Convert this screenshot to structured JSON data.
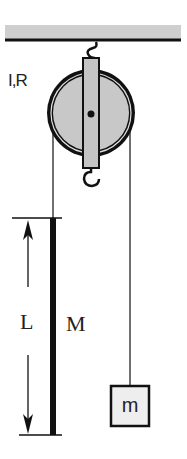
{
  "diagram": {
    "type": "physics-pulley-system",
    "labels": {
      "pulley": "I,R",
      "rod_length": "L",
      "rod_mass": "M",
      "hanging_mass": "m"
    },
    "colors": {
      "ceiling_fill": "#cfcfcf",
      "pulley_fill": "#c8c8c8",
      "bracket_fill": "#c4c4c4",
      "mass_fill": "#eeeeee",
      "line": "#111111"
    }
  }
}
